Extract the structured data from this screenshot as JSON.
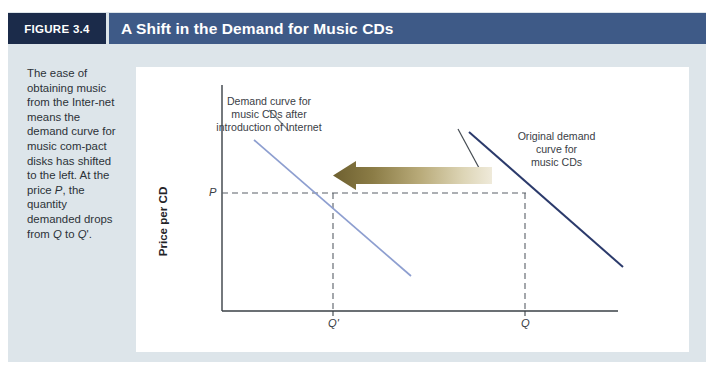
{
  "header": {
    "figure_tag": "FIGURE 3.4",
    "title": "A Shift in the Demand for Music CDs"
  },
  "caption": {
    "text": "The ease of obtaining music from the Inter-net means the demand curve for music com-pact disks has shifted to the left. At the price P, the quantity demanded drops from Q to Q'."
  },
  "colors": {
    "figure_background": "#dde5ea",
    "figure_tag_background": "#1b2b4a",
    "title_bar_background": "#3e5a87",
    "chart_background": "#ffffff",
    "new_demand_curve": "#8e9fd0",
    "original_demand_curve": "#2b3a6b",
    "arrow_dark": "#746634",
    "arrow_light": "#e8e2cc",
    "axis": "#3a4046",
    "dashed_guide": "#5a6068"
  },
  "chart_data": {
    "type": "line",
    "title": "A Shift in the Demand for Music CDs",
    "xlabel": "Quantity of CDs Demanded",
    "ylabel": "Price per CD",
    "grid": false,
    "legend": "none",
    "xticks": [
      "Q'",
      "Q"
    ],
    "yticks": [
      "P"
    ],
    "series": [
      {
        "name": "Demand curve for music CDs after introduction of Internet",
        "color": "#8e9fd0",
        "points": [
          [
            0.155,
            0.92
          ],
          [
            0.66,
            0.2
          ]
        ],
        "label_lines": [
          "Demand curve for",
          "music CDs after",
          "introduction of Internet"
        ]
      },
      {
        "name": "Original demand curve for music CDs",
        "color": "#2b3a6b",
        "points": [
          [
            0.64,
            0.94
          ],
          [
            0.985,
            0.29
          ]
        ],
        "label_lines": [
          "Original demand",
          "curve for",
          "music CDs"
        ]
      }
    ],
    "annotations": [
      {
        "type": "arrow",
        "name": "leftward-shift-arrow",
        "direction": "left",
        "from_x": "Q",
        "to_x": "Q'",
        "note": "demand shifts left"
      },
      {
        "type": "guide",
        "name": "price-line",
        "orientation": "horizontal",
        "value": "P"
      },
      {
        "type": "guide",
        "name": "quantity-line-q-prime",
        "orientation": "vertical",
        "value": "Q'"
      },
      {
        "type": "guide",
        "name": "quantity-line-q",
        "orientation": "vertical",
        "value": "Q"
      }
    ]
  },
  "labels": {
    "new_curve_line1": "Demand curve for",
    "new_curve_line2": "music CDs after",
    "new_curve_line3": "introduction of Internet",
    "original_curve_line1": "Original demand",
    "original_curve_line2": "curve for",
    "original_curve_line3": "music CDs",
    "price_tick": "P",
    "quantity_prime_tick": "Q'",
    "quantity_tick": "Q",
    "x_axis_title": "Quantity of CDs Demanded",
    "y_axis_title": "Price per CD"
  }
}
